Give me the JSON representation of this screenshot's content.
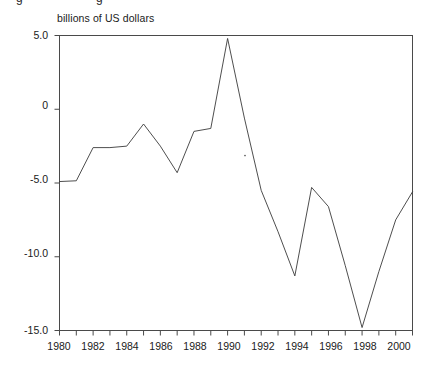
{
  "figure": {
    "partial_top_text": [
      "g",
      "g"
    ],
    "axis_label": "billions of US dollars"
  },
  "chart_data": {
    "type": "line",
    "title": "",
    "subtitle": "",
    "xlabel": "",
    "ylabel": "billions of US dollars",
    "ylim": [
      -15.8,
      5.0
    ],
    "xlim": [
      1980,
      2001
    ],
    "yticks": [
      5.0,
      0,
      -5.0,
      -10.0,
      -15.0
    ],
    "ytick_labels": [
      "5.0",
      "0",
      "-5.0",
      "-10.0",
      "-15.0"
    ],
    "xticks": [
      1980,
      1982,
      1984,
      1986,
      1988,
      1990,
      1992,
      1994,
      1996,
      1998,
      2000
    ],
    "xtick_labels": [
      "1980",
      "1982",
      "1984",
      "1986",
      "1988",
      "1990",
      "1992",
      "1994",
      "1996",
      "1998",
      "2000"
    ],
    "xminor_ticks": [
      1981,
      1983,
      1985,
      1987,
      1989,
      1991,
      1993,
      1995,
      1997,
      1999,
      2001
    ],
    "grid": false,
    "legend": false,
    "legend_position": "none",
    "line_color": "#3a3a3a",
    "line_width": 0.9,
    "markers": "none",
    "frame": "box",
    "x": [
      1980,
      1981,
      1982,
      1983,
      1984,
      1985,
      1986,
      1987,
      1988,
      1989,
      1990,
      1991,
      1992,
      1993,
      1994,
      1995,
      1996,
      1997,
      1998,
      1999,
      2000,
      2001
    ],
    "series": [
      {
        "name": "balance",
        "values": [
          -4.9,
          -4.85,
          -2.6,
          -2.6,
          -2.5,
          -1.0,
          -2.5,
          -4.3,
          -1.5,
          -1.3,
          4.8,
          -0.6,
          -5.5,
          -8.3,
          -11.3,
          -5.3,
          -6.6,
          -10.6,
          -14.8,
          -11.0,
          -7.5,
          -5.6
        ]
      }
    ],
    "annotations": []
  }
}
